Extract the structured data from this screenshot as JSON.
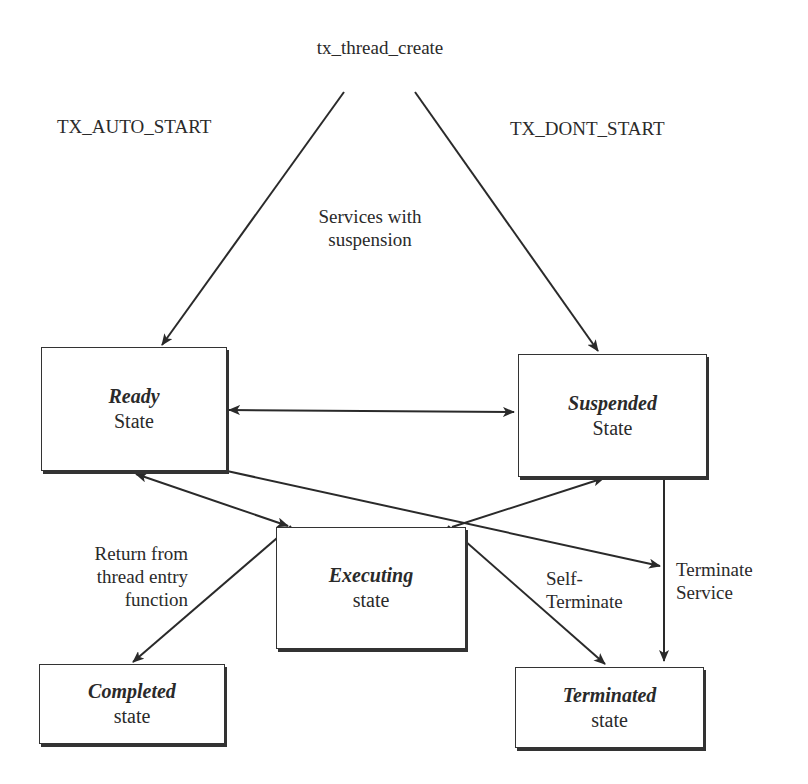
{
  "diagram": {
    "type": "state-transition",
    "start_label": "tx_thread_create",
    "states": [
      {
        "id": "ready",
        "title": "Ready",
        "subtitle": "State"
      },
      {
        "id": "suspended",
        "title": "Suspended",
        "subtitle": "State"
      },
      {
        "id": "executing",
        "title": "Executing",
        "subtitle": "state"
      },
      {
        "id": "completed",
        "title": "Completed",
        "subtitle": "state"
      },
      {
        "id": "terminated",
        "title": "Terminated",
        "subtitle": "state"
      }
    ],
    "transitions": [
      {
        "from": "tx_thread_create",
        "to": "ready",
        "label": "TX_AUTO_START"
      },
      {
        "from": "tx_thread_create",
        "to": "suspended",
        "label": "TX_DONT_START"
      },
      {
        "from": "ready",
        "to": "suspended",
        "bidirectional": true,
        "label": [
          "Services with",
          "suspension"
        ]
      },
      {
        "from": "ready",
        "to": "executing",
        "bidirectional": true,
        "label": [
          "Thread",
          "scheduling"
        ]
      },
      {
        "from": "executing",
        "to": "suspended",
        "label": [
          "Self-",
          "Suspend"
        ]
      },
      {
        "from": "ready",
        "to": "terminate-service-line",
        "label": ""
      },
      {
        "from": "suspended",
        "to": "terminated",
        "label": [
          "Terminate",
          "Service"
        ]
      },
      {
        "from": "executing",
        "to": "completed",
        "label": [
          "Return from",
          "thread entry",
          "function"
        ]
      },
      {
        "from": "executing",
        "to": "terminated",
        "label": [
          "Self-",
          "Terminate"
        ]
      }
    ]
  }
}
